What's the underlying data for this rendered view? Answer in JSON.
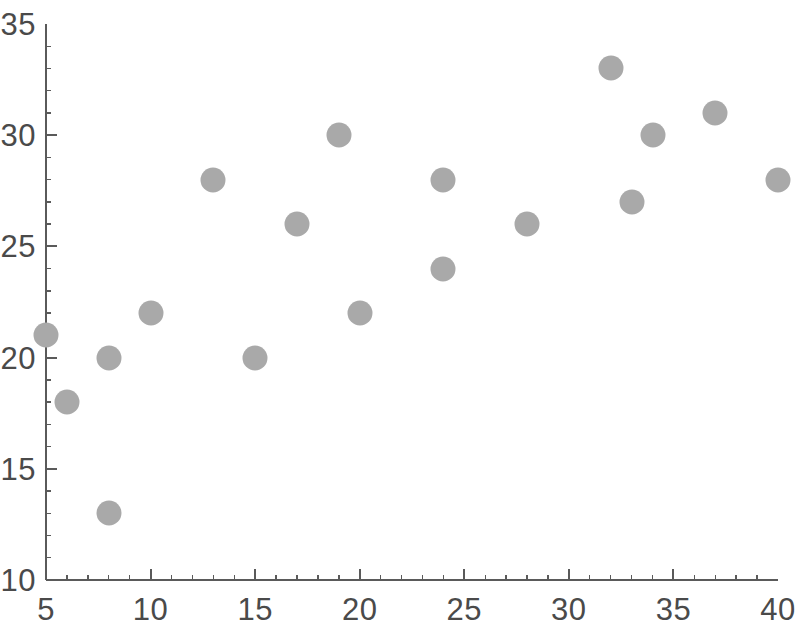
{
  "chart_data": {
    "type": "scatter",
    "title": "",
    "subtitle": "",
    "xlabel": "",
    "ylabel": "",
    "xlim": [
      5,
      40
    ],
    "ylim": [
      10,
      35
    ],
    "xticks": [
      5,
      10,
      15,
      20,
      25,
      30,
      35,
      40
    ],
    "yticks": [
      10,
      15,
      20,
      25,
      30,
      35
    ],
    "xtick_labels": [
      "5",
      "10",
      "15",
      "20",
      "25",
      "30",
      "35",
      "40"
    ],
    "ytick_labels": [
      "10",
      "15",
      "20",
      "25",
      "30",
      "35"
    ],
    "x_minor_tick_step": 1,
    "y_minor_tick_step": 1,
    "grid": false,
    "legend": null,
    "annotations": [],
    "series": [
      {
        "name": "",
        "marker": "circle",
        "marker_color": "#a9a9a9",
        "marker_size": 25,
        "points": [
          {
            "x": 5,
            "y": 21
          },
          {
            "x": 6,
            "y": 18
          },
          {
            "x": 8,
            "y": 20
          },
          {
            "x": 8,
            "y": 13
          },
          {
            "x": 10,
            "y": 22
          },
          {
            "x": 13,
            "y": 28
          },
          {
            "x": 15,
            "y": 20
          },
          {
            "x": 17,
            "y": 26
          },
          {
            "x": 19,
            "y": 30
          },
          {
            "x": 20,
            "y": 22
          },
          {
            "x": 24,
            "y": 28
          },
          {
            "x": 24,
            "y": 24
          },
          {
            "x": 28,
            "y": 26
          },
          {
            "x": 32,
            "y": 33
          },
          {
            "x": 33,
            "y": 27
          },
          {
            "x": 34,
            "y": 30
          },
          {
            "x": 37,
            "y": 31
          },
          {
            "x": 40,
            "y": 28
          }
        ]
      }
    ]
  },
  "style": {
    "axis_color": "#5a5a5a",
    "tick_label_color": "#4a4a4a",
    "background": "#ffffff"
  },
  "geometry": {
    "plot_left_px": 46,
    "plot_right_px": 778,
    "plot_top_px": 24,
    "plot_bottom_px": 580,
    "marker_diameter_px": 25
  }
}
